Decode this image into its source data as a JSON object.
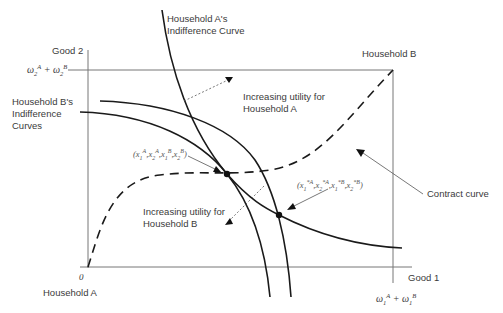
{
  "diagram": {
    "type": "edgeworth-box",
    "axes": {
      "y_label": "Good 2",
      "x_label": "Good 1",
      "origin_label": "0",
      "y_endowment_label": "ω2A + ω2B",
      "x_endowment_label": "ω1A + ω1B"
    },
    "households": {
      "a_label": "Household A",
      "b_label": "Household B"
    },
    "curve_labels": {
      "a_indifference": [
        "Household A's",
        "Indifference Curve"
      ],
      "b_indifference": [
        "Household B's",
        "Indifference",
        "Curves"
      ],
      "contract": "Contract curve"
    },
    "annotations": {
      "utility_a": [
        "Increasing utility for",
        "Household A"
      ],
      "utility_b": [
        "Increasing utility for",
        "Household B"
      ],
      "point_1": "(x1A, x2A, x1B, x2B)",
      "point_2": "(x*1A, x*2A, x*1B, x*2B)"
    },
    "colors": {
      "line": "#1a1a1a",
      "axis": "#777777",
      "text": "#3a3a3a"
    }
  }
}
